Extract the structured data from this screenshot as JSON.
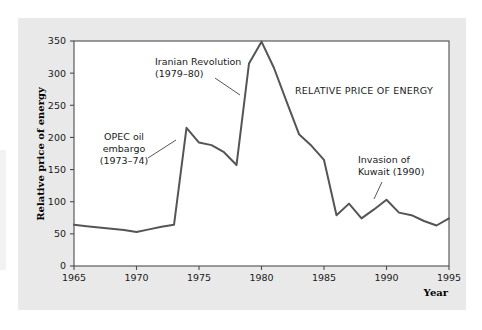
{
  "figure": {
    "panel_bg": "#e9e9e9",
    "plot_bg": "#ffffff",
    "frame_color": "#4d4d4d",
    "line_color": "#555555"
  },
  "chart_data": {
    "type": "line",
    "title": "",
    "series_label": "RELATIVE PRICE OF ENERGY",
    "xlabel": "Year",
    "ylabel": "Relative price of energy",
    "xlim": [
      1965,
      1995
    ],
    "ylim": [
      0,
      350
    ],
    "grid": false,
    "legend_position": "none",
    "xticks": [
      1965,
      1970,
      1975,
      1980,
      1985,
      1990,
      1995
    ],
    "xtick_labels": [
      "1965",
      "1970",
      "1975",
      "1980",
      "1985",
      "1990",
      "1995"
    ],
    "yticks": [
      0,
      50,
      100,
      150,
      200,
      250,
      300,
      350
    ],
    "ytick_labels": [
      "0",
      "50",
      "100",
      "150",
      "200",
      "250",
      "300",
      "350"
    ],
    "x": [
      1965,
      1966,
      1967,
      1968,
      1969,
      1970,
      1971,
      1972,
      1973,
      1974,
      1975,
      1976,
      1977,
      1978,
      1979,
      1980,
      1981,
      1982,
      1983,
      1984,
      1985,
      1986,
      1987,
      1988,
      1989,
      1990,
      1991,
      1992,
      1993,
      1994,
      1995
    ],
    "values": [
      64,
      62,
      60,
      58,
      56,
      53,
      57,
      61,
      64,
      215,
      192,
      188,
      177,
      157,
      315,
      349,
      308,
      256,
      205,
      187,
      165,
      79,
      97,
      74,
      88,
      103,
      83,
      79,
      70,
      63,
      74
    ],
    "annotations": [
      {
        "id": "opec",
        "lines": [
          "OPEC oil",
          "embargo",
          "(1973–74)"
        ],
        "align": "center"
      },
      {
        "id": "iran",
        "lines": [
          "Iranian Revolution",
          "(1979–80)"
        ],
        "align": "start"
      },
      {
        "id": "kuwait",
        "lines": [
          "Invasion of",
          "Kuwait (1990)"
        ],
        "align": "start"
      }
    ]
  }
}
